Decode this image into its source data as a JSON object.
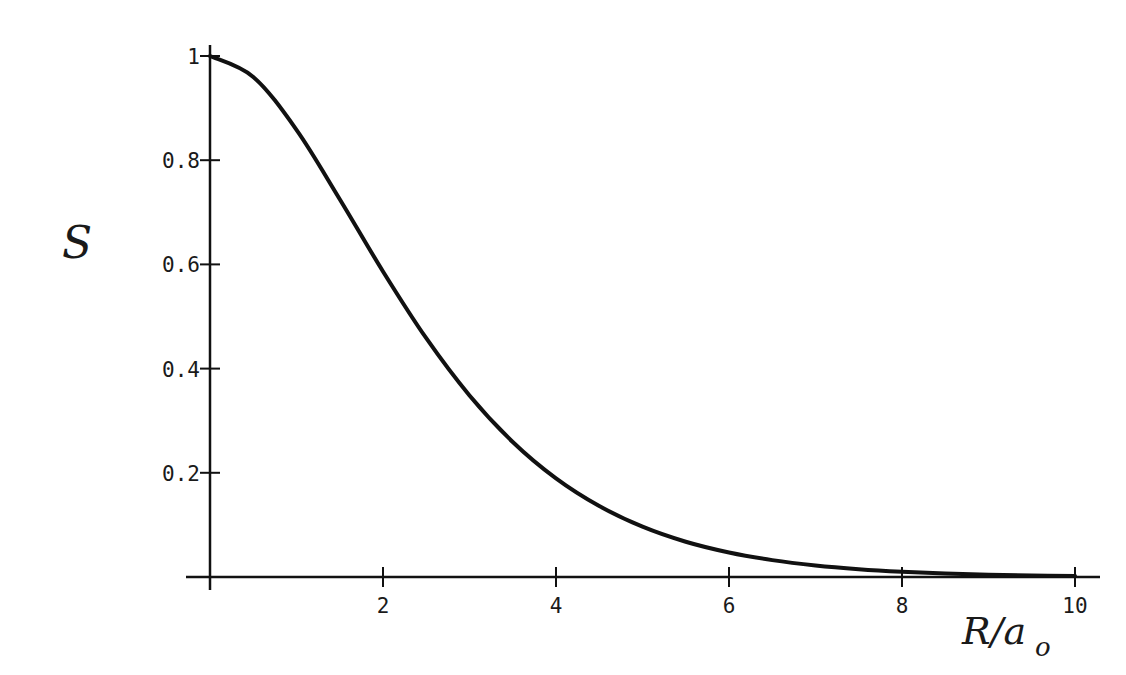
{
  "chart_data": {
    "type": "line",
    "title": "",
    "xlabel": "R/a0",
    "ylabel": "S",
    "xlim": [
      0,
      10
    ],
    "ylim": [
      0,
      1
    ],
    "grid": false,
    "legend": null,
    "x_ticks": [
      2,
      4,
      6,
      8,
      10
    ],
    "x_tick_labels": [
      "2",
      "4",
      "6",
      "8",
      "10"
    ],
    "y_ticks": [
      0.2,
      0.4,
      0.6,
      0.8,
      1
    ],
    "y_tick_labels": [
      "0.2",
      "0.4",
      "0.6",
      "0.8",
      "1"
    ],
    "series": [
      {
        "name": "S",
        "color": "#111111",
        "x": [
          0,
          0.5,
          1,
          1.5,
          2,
          2.5,
          3,
          3.5,
          4,
          4.5,
          5,
          5.5,
          6,
          6.5,
          7,
          7.5,
          8,
          8.5,
          9,
          9.5,
          10
        ],
        "values": [
          1.0,
          0.9598,
          0.8583,
          0.7252,
          0.5865,
          0.4583,
          0.3485,
          0.2592,
          0.1893,
          0.1362,
          0.0966,
          0.0677,
          0.0471,
          0.0324,
          0.0221,
          0.015,
          0.0101,
          0.0067,
          0.0044,
          0.0029,
          0.0019
        ]
      }
    ]
  },
  "axes": {
    "x_label_main": "R/a",
    "x_label_sub": "o",
    "y_label": "S"
  }
}
